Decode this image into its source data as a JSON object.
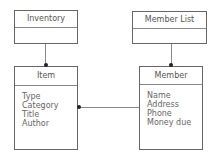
{
  "diagram": {
    "classes": [
      {
        "id": "inventory",
        "name": "Inventory",
        "attributes": []
      },
      {
        "id": "member_list",
        "name": "Member List",
        "attributes": []
      },
      {
        "id": "item",
        "name": "Item",
        "attributes": [
          "Type",
          "Category",
          "Title",
          "Author"
        ]
      },
      {
        "id": "member",
        "name": "Member",
        "attributes": [
          "Name",
          "Address",
          "Phone",
          "Money due"
        ]
      }
    ],
    "connections": [
      {
        "from": "inventory",
        "to": "item",
        "end": "dot"
      },
      {
        "from": "member_list",
        "to": "member",
        "end": "dot"
      },
      {
        "from": "member",
        "to": "item",
        "end": "dot"
      }
    ],
    "colors": {
      "line": "#888888",
      "dot": "#222222",
      "text": "#555555"
    }
  }
}
